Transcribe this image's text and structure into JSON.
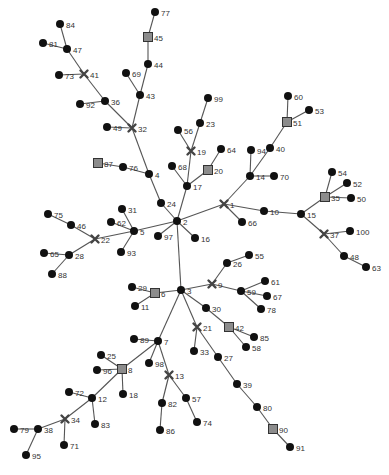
{
  "diagram": {
    "type": "tree-graph",
    "legend_shapes": {
      "circle": "regular node",
      "square": "square node",
      "cross": "cross node"
    },
    "colors": {
      "edge": "#555555",
      "circle": "#111111",
      "square_fill": "#8c8c8c",
      "cross": "#444444",
      "label": "#333333"
    },
    "nodes": [
      {
        "id": "77",
        "x": 155,
        "y": 12,
        "shape": "circle"
      },
      {
        "id": "45",
        "x": 148,
        "y": 37,
        "shape": "square"
      },
      {
        "id": "44",
        "x": 148,
        "y": 64,
        "shape": "circle"
      },
      {
        "id": "69",
        "x": 126,
        "y": 73,
        "shape": "circle"
      },
      {
        "id": "43",
        "x": 140,
        "y": 95,
        "shape": "circle"
      },
      {
        "id": "32",
        "x": 132,
        "y": 128,
        "shape": "cross"
      },
      {
        "id": "49",
        "x": 107,
        "y": 127,
        "shape": "circle"
      },
      {
        "id": "36",
        "x": 105,
        "y": 101,
        "shape": "circle"
      },
      {
        "id": "92",
        "x": 80,
        "y": 104,
        "shape": "circle"
      },
      {
        "id": "41",
        "x": 84,
        "y": 74,
        "shape": "cross"
      },
      {
        "id": "73",
        "x": 59,
        "y": 75,
        "shape": "circle"
      },
      {
        "id": "47",
        "x": 67,
        "y": 49,
        "shape": "circle"
      },
      {
        "id": "81",
        "x": 43,
        "y": 43,
        "shape": "circle"
      },
      {
        "id": "84",
        "x": 60,
        "y": 24,
        "shape": "circle"
      },
      {
        "id": "4",
        "x": 149,
        "y": 174,
        "shape": "circle"
      },
      {
        "id": "76",
        "x": 123,
        "y": 167,
        "shape": "circle"
      },
      {
        "id": "87",
        "x": 98,
        "y": 163,
        "shape": "square"
      },
      {
        "id": "24",
        "x": 161,
        "y": 203,
        "shape": "circle"
      },
      {
        "id": "2",
        "x": 177,
        "y": 221,
        "shape": "circle"
      },
      {
        "id": "99",
        "x": 208,
        "y": 98,
        "shape": "circle"
      },
      {
        "id": "23",
        "x": 200,
        "y": 123,
        "shape": "circle"
      },
      {
        "id": "56",
        "x": 178,
        "y": 130,
        "shape": "circle"
      },
      {
        "id": "19",
        "x": 191,
        "y": 151,
        "shape": "cross"
      },
      {
        "id": "64",
        "x": 221,
        "y": 149,
        "shape": "circle"
      },
      {
        "id": "20",
        "x": 208,
        "y": 170,
        "shape": "square"
      },
      {
        "id": "68",
        "x": 172,
        "y": 166,
        "shape": "circle"
      },
      {
        "id": "17",
        "x": 187,
        "y": 186,
        "shape": "circle"
      },
      {
        "id": "1",
        "x": 224,
        "y": 204,
        "shape": "cross"
      },
      {
        "id": "66",
        "x": 242,
        "y": 222,
        "shape": "circle"
      },
      {
        "id": "14",
        "x": 250,
        "y": 176,
        "shape": "circle"
      },
      {
        "id": "94",
        "x": 251,
        "y": 150,
        "shape": "circle"
      },
      {
        "id": "70",
        "x": 274,
        "y": 176,
        "shape": "circle"
      },
      {
        "id": "40",
        "x": 270,
        "y": 148,
        "shape": "circle"
      },
      {
        "id": "51",
        "x": 287,
        "y": 122,
        "shape": "square"
      },
      {
        "id": "60",
        "x": 288,
        "y": 96,
        "shape": "circle"
      },
      {
        "id": "53",
        "x": 309,
        "y": 110,
        "shape": "circle"
      },
      {
        "id": "10",
        "x": 264,
        "y": 211,
        "shape": "circle"
      },
      {
        "id": "15",
        "x": 301,
        "y": 214,
        "shape": "circle"
      },
      {
        "id": "35",
        "x": 325,
        "y": 197,
        "shape": "square"
      },
      {
        "id": "54",
        "x": 332,
        "y": 172,
        "shape": "circle"
      },
      {
        "id": "52",
        "x": 347,
        "y": 183,
        "shape": "circle"
      },
      {
        "id": "50",
        "x": 351,
        "y": 198,
        "shape": "circle"
      },
      {
        "id": "37",
        "x": 324,
        "y": 234,
        "shape": "cross"
      },
      {
        "id": "100",
        "x": 350,
        "y": 231,
        "shape": "circle"
      },
      {
        "id": "48",
        "x": 344,
        "y": 256,
        "shape": "circle"
      },
      {
        "id": "63",
        "x": 366,
        "y": 267,
        "shape": "circle"
      },
      {
        "id": "16",
        "x": 195,
        "y": 238,
        "shape": "circle"
      },
      {
        "id": "97",
        "x": 158,
        "y": 236,
        "shape": "circle"
      },
      {
        "id": "5",
        "x": 134,
        "y": 231,
        "shape": "circle"
      },
      {
        "id": "31",
        "x": 122,
        "y": 209,
        "shape": "circle"
      },
      {
        "id": "62",
        "x": 111,
        "y": 222,
        "shape": "circle"
      },
      {
        "id": "93",
        "x": 121,
        "y": 252,
        "shape": "circle"
      },
      {
        "id": "22",
        "x": 95,
        "y": 239,
        "shape": "cross"
      },
      {
        "id": "46",
        "x": 71,
        "y": 225,
        "shape": "circle"
      },
      {
        "id": "75",
        "x": 48,
        "y": 214,
        "shape": "circle"
      },
      {
        "id": "28",
        "x": 69,
        "y": 255,
        "shape": "circle"
      },
      {
        "id": "65",
        "x": 44,
        "y": 253,
        "shape": "circle"
      },
      {
        "id": "88",
        "x": 52,
        "y": 274,
        "shape": "circle"
      },
      {
        "id": "3",
        "x": 181,
        "y": 290,
        "shape": "circle"
      },
      {
        "id": "6",
        "x": 155,
        "y": 293,
        "shape": "square"
      },
      {
        "id": "29",
        "x": 132,
        "y": 287,
        "shape": "circle"
      },
      {
        "id": "11",
        "x": 135,
        "y": 306,
        "shape": "circle"
      },
      {
        "id": "9",
        "x": 212,
        "y": 284,
        "shape": "cross"
      },
      {
        "id": "26",
        "x": 227,
        "y": 263,
        "shape": "circle"
      },
      {
        "id": "55",
        "x": 249,
        "y": 255,
        "shape": "circle"
      },
      {
        "id": "59",
        "x": 241,
        "y": 291,
        "shape": "circle"
      },
      {
        "id": "61",
        "x": 265,
        "y": 281,
        "shape": "circle"
      },
      {
        "id": "67",
        "x": 267,
        "y": 296,
        "shape": "circle"
      },
      {
        "id": "78",
        "x": 261,
        "y": 309,
        "shape": "circle"
      },
      {
        "id": "30",
        "x": 206,
        "y": 308,
        "shape": "circle"
      },
      {
        "id": "42",
        "x": 229,
        "y": 327,
        "shape": "square"
      },
      {
        "id": "85",
        "x": 254,
        "y": 337,
        "shape": "circle"
      },
      {
        "id": "58",
        "x": 246,
        "y": 347,
        "shape": "circle"
      },
      {
        "id": "21",
        "x": 197,
        "y": 327,
        "shape": "cross"
      },
      {
        "id": "33",
        "x": 194,
        "y": 351,
        "shape": "circle"
      },
      {
        "id": "27",
        "x": 218,
        "y": 357,
        "shape": "circle"
      },
      {
        "id": "39",
        "x": 237,
        "y": 384,
        "shape": "circle"
      },
      {
        "id": "80",
        "x": 257,
        "y": 407,
        "shape": "circle"
      },
      {
        "id": "90",
        "x": 273,
        "y": 429,
        "shape": "square"
      },
      {
        "id": "91",
        "x": 290,
        "y": 447,
        "shape": "circle"
      },
      {
        "id": "7",
        "x": 158,
        "y": 341,
        "shape": "circle"
      },
      {
        "id": "89",
        "x": 134,
        "y": 339,
        "shape": "circle"
      },
      {
        "id": "98",
        "x": 149,
        "y": 363,
        "shape": "circle"
      },
      {
        "id": "8",
        "x": 122,
        "y": 369,
        "shape": "square"
      },
      {
        "id": "25",
        "x": 101,
        "y": 355,
        "shape": "circle"
      },
      {
        "id": "96",
        "x": 97,
        "y": 370,
        "shape": "circle"
      },
      {
        "id": "18",
        "x": 123,
        "y": 394,
        "shape": "circle"
      },
      {
        "id": "13",
        "x": 169,
        "y": 375,
        "shape": "cross"
      },
      {
        "id": "82",
        "x": 162,
        "y": 403,
        "shape": "circle"
      },
      {
        "id": "86",
        "x": 160,
        "y": 430,
        "shape": "circle"
      },
      {
        "id": "57",
        "x": 186,
        "y": 398,
        "shape": "circle"
      },
      {
        "id": "74",
        "x": 197,
        "y": 422,
        "shape": "circle"
      },
      {
        "id": "12",
        "x": 92,
        "y": 398,
        "shape": "circle"
      },
      {
        "id": "72",
        "x": 69,
        "y": 392,
        "shape": "circle"
      },
      {
        "id": "83",
        "x": 95,
        "y": 424,
        "shape": "circle"
      },
      {
        "id": "34",
        "x": 65,
        "y": 419,
        "shape": "cross"
      },
      {
        "id": "71",
        "x": 64,
        "y": 445,
        "shape": "circle"
      },
      {
        "id": "38",
        "x": 38,
        "y": 429,
        "shape": "circle"
      },
      {
        "id": "79",
        "x": 14,
        "y": 429,
        "shape": "circle"
      },
      {
        "id": "95",
        "x": 26,
        "y": 455,
        "shape": "circle"
      }
    ],
    "edges": [
      [
        "77",
        "45"
      ],
      [
        "45",
        "44"
      ],
      [
        "44",
        "43"
      ],
      [
        "69",
        "43"
      ],
      [
        "43",
        "32"
      ],
      [
        "49",
        "32"
      ],
      [
        "32",
        "36"
      ],
      [
        "92",
        "36"
      ],
      [
        "36",
        "41"
      ],
      [
        "73",
        "41"
      ],
      [
        "41",
        "47"
      ],
      [
        "81",
        "47"
      ],
      [
        "84",
        "47"
      ],
      [
        "32",
        "4"
      ],
      [
        "87",
        "76"
      ],
      [
        "76",
        "4"
      ],
      [
        "4",
        "24"
      ],
      [
        "24",
        "2"
      ],
      [
        "99",
        "23"
      ],
      [
        "23",
        "19"
      ],
      [
        "56",
        "19"
      ],
      [
        "19",
        "17"
      ],
      [
        "64",
        "20"
      ],
      [
        "20",
        "17"
      ],
      [
        "68",
        "17"
      ],
      [
        "17",
        "2"
      ],
      [
        "2",
        "1"
      ],
      [
        "1",
        "66"
      ],
      [
        "1",
        "14"
      ],
      [
        "14",
        "94"
      ],
      [
        "14",
        "70"
      ],
      [
        "14",
        "40"
      ],
      [
        "40",
        "51"
      ],
      [
        "51",
        "60"
      ],
      [
        "51",
        "53"
      ],
      [
        "1",
        "10"
      ],
      [
        "10",
        "15"
      ],
      [
        "15",
        "35"
      ],
      [
        "35",
        "54"
      ],
      [
        "35",
        "52"
      ],
      [
        "35",
        "50"
      ],
      [
        "15",
        "37"
      ],
      [
        "37",
        "100"
      ],
      [
        "37",
        "48"
      ],
      [
        "48",
        "63"
      ],
      [
        "2",
        "16"
      ],
      [
        "2",
        "97"
      ],
      [
        "2",
        "5"
      ],
      [
        "5",
        "31"
      ],
      [
        "5",
        "62"
      ],
      [
        "5",
        "93"
      ],
      [
        "5",
        "22"
      ],
      [
        "22",
        "46"
      ],
      [
        "46",
        "75"
      ],
      [
        "22",
        "28"
      ],
      [
        "28",
        "65"
      ],
      [
        "28",
        "88"
      ],
      [
        "2",
        "3"
      ],
      [
        "3",
        "6"
      ],
      [
        "6",
        "29"
      ],
      [
        "6",
        "11"
      ],
      [
        "3",
        "9"
      ],
      [
        "9",
        "26"
      ],
      [
        "26",
        "55"
      ],
      [
        "9",
        "59"
      ],
      [
        "59",
        "61"
      ],
      [
        "59",
        "67"
      ],
      [
        "59",
        "78"
      ],
      [
        "3",
        "30"
      ],
      [
        "30",
        "42"
      ],
      [
        "42",
        "85"
      ],
      [
        "42",
        "58"
      ],
      [
        "3",
        "21"
      ],
      [
        "21",
        "33"
      ],
      [
        "21",
        "27"
      ],
      [
        "27",
        "39"
      ],
      [
        "39",
        "80"
      ],
      [
        "80",
        "90"
      ],
      [
        "90",
        "91"
      ],
      [
        "3",
        "7"
      ],
      [
        "7",
        "89"
      ],
      [
        "7",
        "98"
      ],
      [
        "7",
        "8"
      ],
      [
        "8",
        "25"
      ],
      [
        "8",
        "96"
      ],
      [
        "8",
        "18"
      ],
      [
        "7",
        "13"
      ],
      [
        "13",
        "82"
      ],
      [
        "82",
        "86"
      ],
      [
        "13",
        "57"
      ],
      [
        "57",
        "74"
      ],
      [
        "8",
        "12"
      ],
      [
        "12",
        "72"
      ],
      [
        "12",
        "83"
      ],
      [
        "12",
        "34"
      ],
      [
        "34",
        "71"
      ],
      [
        "34",
        "38"
      ],
      [
        "38",
        "79"
      ],
      [
        "38",
        "95"
      ]
    ]
  }
}
